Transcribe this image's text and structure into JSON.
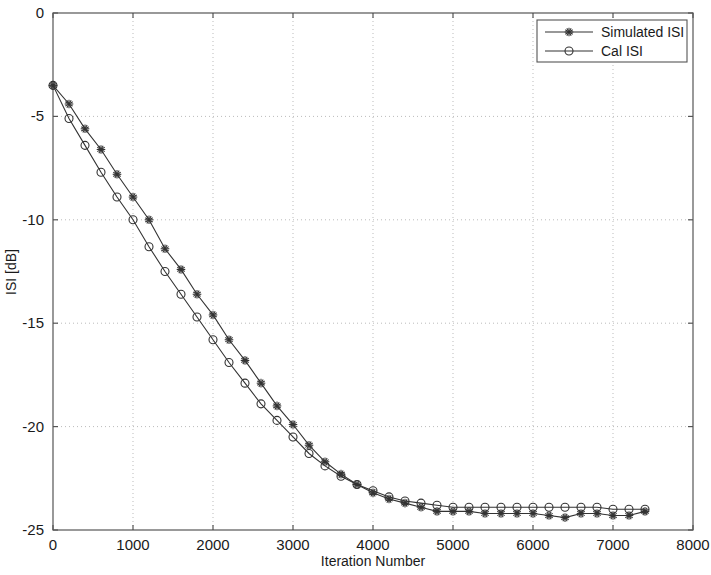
{
  "chart_data": {
    "type": "line",
    "title": "",
    "xlabel": "Iteration Number",
    "ylabel": "ISI [dB]",
    "xlim": [
      0,
      8000
    ],
    "ylim": [
      -25,
      0
    ],
    "xticks": [
      0,
      1000,
      2000,
      3000,
      4000,
      5000,
      6000,
      7000,
      8000
    ],
    "xtick_labels": [
      "0",
      "1000",
      "2000",
      "3000",
      "4000",
      "5000",
      "6000",
      "7000",
      "8000"
    ],
    "yticks": [
      0,
      -5,
      -10,
      -15,
      -20,
      -25
    ],
    "ytick_labels": [
      "0",
      "-5",
      "-10",
      "-15",
      "-20",
      "-25"
    ],
    "grid": true,
    "grid_style": "dotted",
    "legend_position": "top-right",
    "series": [
      {
        "name": "Simulated ISI",
        "marker": "star",
        "color": "#333333",
        "x": [
          0,
          200,
          400,
          600,
          800,
          1000,
          1200,
          1400,
          1600,
          1800,
          2000,
          2200,
          2400,
          2600,
          2800,
          3000,
          3200,
          3400,
          3600,
          3800,
          4000,
          4200,
          4400,
          4600,
          4800,
          5000,
          5200,
          5400,
          5600,
          5800,
          6000,
          6200,
          6400,
          6600,
          6800,
          7000,
          7200,
          7400
        ],
        "y": [
          -3.5,
          -4.4,
          -5.6,
          -6.6,
          -7.8,
          -8.9,
          -10.0,
          -11.4,
          -12.4,
          -13.6,
          -14.6,
          -15.8,
          -16.8,
          -17.9,
          -19.0,
          -19.9,
          -20.9,
          -21.7,
          -22.3,
          -22.8,
          -23.2,
          -23.5,
          -23.7,
          -23.9,
          -24.1,
          -24.1,
          -24.1,
          -24.2,
          -24.2,
          -24.2,
          -24.2,
          -24.3,
          -24.4,
          -24.2,
          -24.2,
          -24.3,
          -24.3,
          -24.1
        ]
      },
      {
        "name": "Cal ISI",
        "marker": "circle",
        "color": "#333333",
        "x": [
          0,
          200,
          400,
          600,
          800,
          1000,
          1200,
          1400,
          1600,
          1800,
          2000,
          2200,
          2400,
          2600,
          2800,
          3000,
          3200,
          3400,
          3600,
          3800,
          4000,
          4200,
          4400,
          4600,
          4800,
          5000,
          5200,
          5400,
          5600,
          5800,
          6000,
          6200,
          6400,
          6600,
          6800,
          7000,
          7200,
          7400
        ],
        "y": [
          -3.5,
          -5.1,
          -6.4,
          -7.7,
          -8.9,
          -10.0,
          -11.3,
          -12.5,
          -13.6,
          -14.7,
          -15.8,
          -16.9,
          -17.9,
          -18.9,
          -19.7,
          -20.5,
          -21.3,
          -21.9,
          -22.4,
          -22.8,
          -23.1,
          -23.4,
          -23.6,
          -23.7,
          -23.8,
          -23.9,
          -23.9,
          -23.9,
          -23.9,
          -23.9,
          -23.9,
          -23.9,
          -23.9,
          -23.9,
          -23.9,
          -24.0,
          -24.0,
          -24.0
        ]
      }
    ]
  },
  "legend": {
    "entries": [
      {
        "label": "Simulated ISI",
        "marker": "star-marker"
      },
      {
        "label": "Cal ISI",
        "marker": "circle-marker"
      }
    ]
  },
  "colors": {
    "background": "#ffffff",
    "axis": "#555555",
    "grid": "#bbbbbb",
    "line": "#333333",
    "text": "#1a1a1a"
  }
}
